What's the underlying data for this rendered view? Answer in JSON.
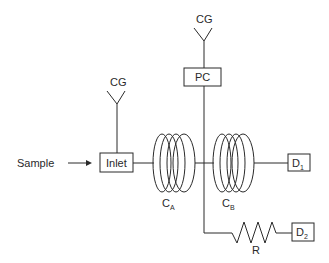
{
  "diagram": {
    "type": "gas chromatography flow schematic",
    "colors": {
      "stroke": "#2a2a2a",
      "background": "#ffffff"
    },
    "nodes": {
      "sample": {
        "label": "Sample"
      },
      "cg_inlet": {
        "label": "CG"
      },
      "inlet": {
        "label": "Inlet"
      },
      "cg_pc": {
        "label": "CG"
      },
      "pc": {
        "label": "PC"
      },
      "column_a": {
        "label": "C",
        "subscript": "A"
      },
      "column_b": {
        "label": "C",
        "subscript": "B"
      },
      "detector_1": {
        "label": "D",
        "subscript": "1"
      },
      "detector_2": {
        "label": "D",
        "subscript": "2"
      },
      "restrictor": {
        "label": "R"
      }
    },
    "edges": [
      {
        "from": "Sample",
        "to": "Inlet",
        "style": "arrow"
      },
      {
        "from": "CG",
        "to": "Inlet"
      },
      {
        "from": "Inlet",
        "to": "C_A"
      },
      {
        "from": "C_A",
        "to": "C_B"
      },
      {
        "from": "CG",
        "to": "PC"
      },
      {
        "from": "PC",
        "to": "C_A/C_B junction"
      },
      {
        "from": "C_B",
        "to": "D_1"
      },
      {
        "from": "junction",
        "to": "R"
      },
      {
        "from": "R",
        "to": "D_2"
      }
    ]
  }
}
